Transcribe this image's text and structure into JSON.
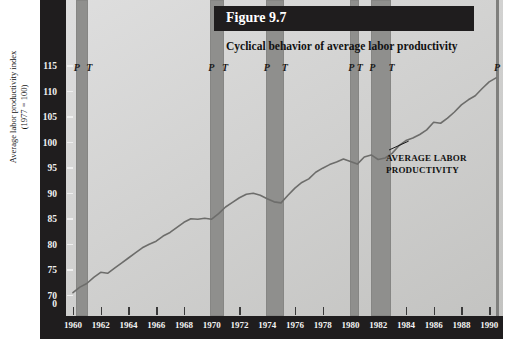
{
  "figure": {
    "banner_label": "Figure 9.7",
    "subtitle": "Cyclical behavior of average labor productivity",
    "annotation_line1": "AVERAGE LABOR",
    "annotation_line2": "PRODUCTIVITY",
    "peak_marker": "P",
    "trough_marker": "T"
  },
  "chart_data": {
    "type": "line",
    "title": "Cyclical behavior of average labor productivity",
    "xlabel": "",
    "ylabel": "Average labor productivity index (1977 = 100)",
    "ylabel_line1": "Average labor productivity index",
    "ylabel_line2": "(1977 = 100)",
    "xlim": [
      1959.5,
      1991.0
    ],
    "ylim": [
      68,
      116
    ],
    "yticks": [
      70,
      75,
      80,
      85,
      90,
      95,
      100,
      105,
      110,
      115
    ],
    "ytick_zero": "0",
    "xticks": [
      1960,
      1962,
      1964,
      1966,
      1968,
      1970,
      1972,
      1974,
      1976,
      1978,
      1980,
      1982,
      1984,
      1986,
      1988,
      1990
    ],
    "grid": false,
    "legend": "none",
    "series": [
      {
        "name": "Average labor productivity",
        "x": [
          1960.0,
          1960.5,
          1961.0,
          1961.5,
          1962.0,
          1962.5,
          1963.0,
          1963.5,
          1964.0,
          1964.5,
          1965.0,
          1965.5,
          1966.0,
          1966.5,
          1967.0,
          1967.5,
          1968.0,
          1968.5,
          1969.0,
          1969.5,
          1970.0,
          1970.5,
          1971.0,
          1971.5,
          1972.0,
          1972.5,
          1973.0,
          1973.5,
          1974.0,
          1974.5,
          1975.0,
          1975.5,
          1976.0,
          1976.5,
          1977.0,
          1977.5,
          1978.0,
          1978.5,
          1979.0,
          1979.5,
          1980.0,
          1980.5,
          1981.0,
          1981.5,
          1982.0,
          1982.5,
          1983.0,
          1983.5,
          1984.0,
          1984.5,
          1985.0,
          1985.5,
          1986.0,
          1986.5,
          1987.0,
          1987.5,
          1988.0,
          1988.5,
          1989.0,
          1989.5,
          1990.0,
          1990.5
        ],
        "y": [
          70.8,
          71.9,
          72.6,
          73.8,
          74.8,
          74.6,
          75.6,
          76.6,
          77.6,
          78.6,
          79.6,
          80.3,
          80.9,
          81.9,
          82.6,
          83.6,
          84.6,
          85.3,
          85.2,
          85.4,
          85.2,
          86.3,
          87.6,
          88.5,
          89.4,
          90.1,
          90.3,
          89.9,
          89.2,
          88.6,
          88.4,
          89.9,
          91.3,
          92.4,
          93.1,
          94.4,
          95.2,
          95.9,
          96.4,
          97.0,
          96.5,
          96.0,
          97.4,
          97.8,
          96.9,
          97.2,
          98.1,
          99.6,
          100.6,
          101.1,
          101.8,
          102.7,
          104.2,
          104.0,
          105.0,
          106.2,
          107.6,
          108.6,
          109.4,
          110.8,
          112.1,
          112.9
        ]
      }
    ],
    "recessions": [
      {
        "peak_year": 1960.2,
        "trough_year": 1961.1,
        "peak_label": "P",
        "trough_label": "T"
      },
      {
        "peak_year": 1969.9,
        "trough_year": 1970.9,
        "peak_label": "P",
        "trough_label": "T"
      },
      {
        "peak_year": 1973.9,
        "trough_year": 1975.2,
        "peak_label": "P",
        "trough_label": "T"
      },
      {
        "peak_year": 1980.0,
        "trough_year": 1980.6,
        "peak_label": "P",
        "trough_label": "T"
      },
      {
        "peak_year": 1981.5,
        "trough_year": 1982.9,
        "peak_label": "P",
        "trough_label": "T"
      },
      {
        "peak_year": 1990.5,
        "trough_year": null,
        "peak_label": "P",
        "trough_label": ""
      }
    ],
    "annotations": [
      {
        "text": "AVERAGE LABOR PRODUCTIVITY",
        "points_to_year": 1984.2,
        "points_to_value": 100.5
      }
    ]
  }
}
